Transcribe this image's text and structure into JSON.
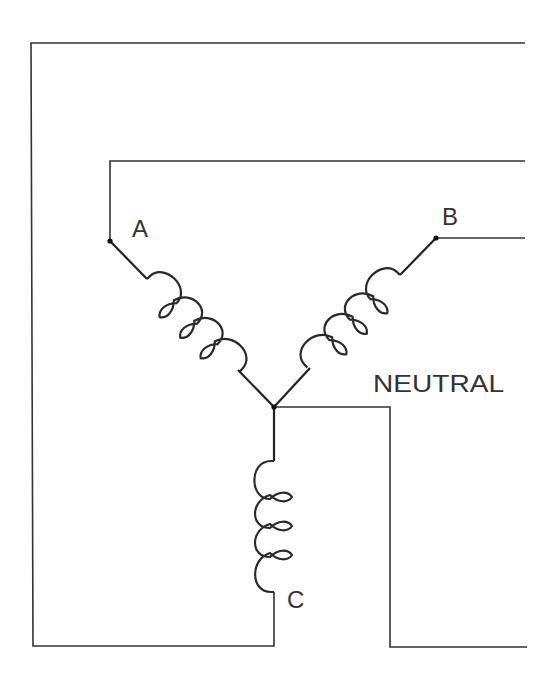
{
  "diagram": {
    "colors": {
      "line": "#333333",
      "background": "#ffffff"
    },
    "labels": {
      "phase_a": "A",
      "phase_b": "B",
      "phase_c": "C",
      "neutral": "NEUTRAL"
    },
    "nodes": [
      {
        "id": "terminal-a",
        "label": "A"
      },
      {
        "id": "terminal-b",
        "label": "B"
      },
      {
        "id": "neutral-junction",
        "label": ""
      }
    ],
    "windings": [
      {
        "id": "coil-a",
        "between": [
          "terminal-a",
          "neutral-junction"
        ],
        "turns": 3
      },
      {
        "id": "coil-b",
        "between": [
          "terminal-b",
          "neutral-junction"
        ],
        "turns": 3
      },
      {
        "id": "coil-c",
        "between": [
          "neutral-junction",
          "line-c"
        ],
        "turns": 3
      }
    ],
    "lines": [
      "line-a",
      "line-b",
      "line-c",
      "neutral-line"
    ]
  }
}
